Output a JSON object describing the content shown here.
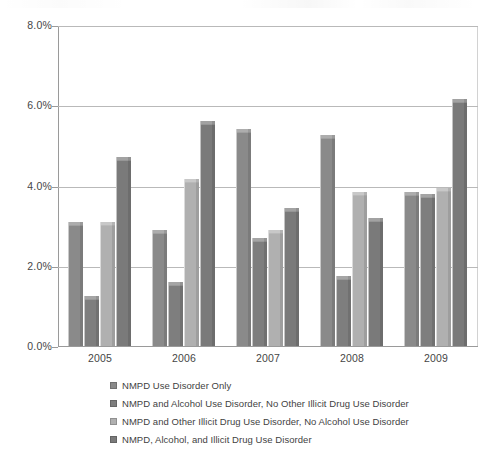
{
  "chart_data": {
    "type": "bar",
    "title": "",
    "subtitle": "",
    "xlabel": "",
    "ylabel": "",
    "categories": [
      "2005",
      "2006",
      "2007",
      "2008",
      "2009"
    ],
    "ylim": [
      0,
      8
    ],
    "yticks": [
      "0.0%",
      "2.0%",
      "4.0%",
      "6.0%",
      "8.0%"
    ],
    "ytick_values": [
      0,
      2,
      4,
      6,
      8
    ],
    "y_unit": "%",
    "grid": true,
    "legend_position": "bottom-left",
    "series": [
      {
        "name": "NMPD Use Disorder Only",
        "color": "#8a8a8a",
        "values": [
          3.1,
          2.9,
          5.4,
          5.25,
          3.85
        ]
      },
      {
        "name": "NMPD and Alcohol Use Disorder, No Other Illicit Drug Use Disorder",
        "color": "#7e7e7e",
        "values": [
          1.25,
          1.6,
          2.7,
          1.75,
          3.8
        ]
      },
      {
        "name": "NMPD and Other Illicit Drug Use Disorder, No Alcohol Use Disorder",
        "color": "#b0b0b0",
        "values": [
          3.1,
          4.15,
          2.9,
          3.85,
          3.95
        ]
      },
      {
        "name": "NMPD, Alcohol, and Illicit Drug Use Disorder",
        "color": "#7a7a7a",
        "values": [
          4.7,
          5.6,
          3.45,
          3.2,
          6.15
        ]
      }
    ]
  },
  "legend": {
    "items": [
      {
        "label": "NMPD Use Disorder Only",
        "swatch": "#8a8a8a"
      },
      {
        "label": "NMPD and Alcohol Use Disorder, No Other Illicit Drug Use Disorder",
        "swatch": "#7e7e7e"
      },
      {
        "label": "NMPD and Other Illicit Drug Use Disorder, No Alcohol Use Disorder",
        "swatch": "#b0b0b0"
      },
      {
        "label": "NMPD, Alcohol, and Illicit Drug Use Disorder",
        "swatch": "#7a7a7a"
      }
    ]
  }
}
